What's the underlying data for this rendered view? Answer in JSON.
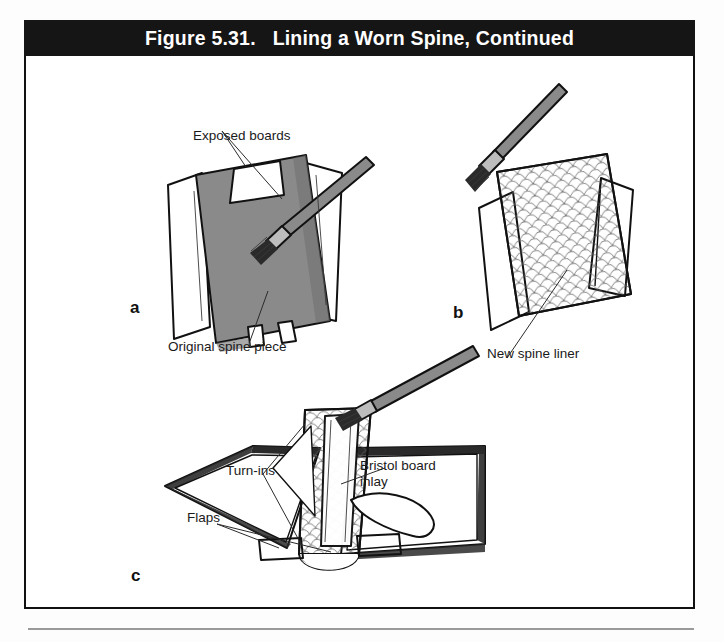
{
  "figure": {
    "title": "Figure 5.31.   Lining a Worn Spine, Continued",
    "frame_color": "#111111",
    "banner_color": "#151515",
    "banner_text_color": "#ffffff",
    "page_background": "#ffffff",
    "rule_color": "#9a9a9a"
  },
  "palette": {
    "ink": "#111111",
    "spine_gray": "#8a8a8a",
    "board_edge_gray": "#6f6f6f",
    "liner_fill": "#f2f2f2",
    "flap_gray": "#7d7d7d"
  },
  "panels": [
    {
      "id": "a",
      "letter": "a",
      "caption_top": "Exposed boards",
      "caption_bottom": "Original spine piece",
      "description": "Book case standing open with the original spine piece being lifted away; a paste brush works along the right board edge."
    },
    {
      "id": "b",
      "letter": "b",
      "caption_bottom": "New spine liner",
      "description": "New patterned spine liner held in place while a paste brush applies adhesive at the top left corner."
    },
    {
      "id": "c",
      "letter": "c",
      "labels": [
        {
          "name": "turn-ins",
          "text": "Turn-ins"
        },
        {
          "name": "flaps",
          "text": "Flaps"
        },
        {
          "name": "bristol-board-inlay",
          "text": "Bristol board\ninlay"
        }
      ],
      "description": "Open book case laid flat with new spine liner, bristol board inlay, turn-ins and flaps identified; a brush pastes the spine and a bone folder rests on the right board."
    }
  ]
}
